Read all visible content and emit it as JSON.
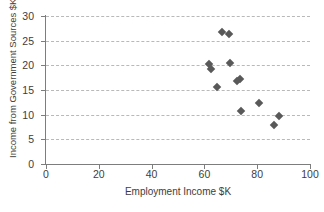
{
  "chart_data": {
    "type": "scatter",
    "title": "",
    "xlabel": "Employment Income $K",
    "ylabel": "Income from Government Sources $K",
    "xlim": [
      0,
      100
    ],
    "ylim": [
      0,
      30
    ],
    "xticks": [
      0,
      20,
      40,
      60,
      80,
      100
    ],
    "yticks": [
      0,
      5,
      10,
      15,
      20,
      25,
      30
    ],
    "grid": "horizontal-dashed",
    "legend": null,
    "marker": "diamond",
    "marker_color": "#595959",
    "points": [
      {
        "x": 66.5,
        "y": 26.7
      },
      {
        "x": 69.5,
        "y": 26.3
      },
      {
        "x": 61.8,
        "y": 20.3
      },
      {
        "x": 69.8,
        "y": 20.4
      },
      {
        "x": 62.5,
        "y": 19.2
      },
      {
        "x": 73.5,
        "y": 17.3
      },
      {
        "x": 72.5,
        "y": 16.8
      },
      {
        "x": 64.8,
        "y": 15.7
      },
      {
        "x": 80.8,
        "y": 12.3
      },
      {
        "x": 73.8,
        "y": 10.7
      },
      {
        "x": 88.2,
        "y": 9.7
      },
      {
        "x": 86.5,
        "y": 7.9
      }
    ]
  },
  "axes": {
    "x_tick_labels": [
      "0",
      "20",
      "40",
      "60",
      "80",
      "100"
    ],
    "y_tick_labels": [
      "0",
      "5",
      "10",
      "15",
      "20",
      "25",
      "30"
    ],
    "x_title": "Employment Income $K",
    "y_title": "Income from Government Sources $K"
  },
  "colors": {
    "marker": "#595959",
    "axis": "#7d7d7d",
    "grid": "#b9b9b9",
    "text": "#3d3d3d",
    "background": "#ffffff"
  }
}
